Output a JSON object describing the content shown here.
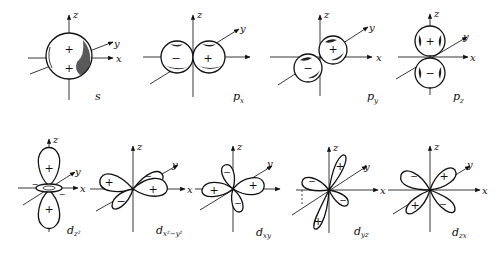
{
  "figure": {
    "axes_labels": {
      "x": "x",
      "y": "y",
      "z": "z"
    },
    "orbitals": [
      {
        "id": "s",
        "label_main": "s",
        "label_sub": "",
        "signs": [
          "+",
          "+"
        ]
      },
      {
        "id": "px",
        "label_main": "p",
        "label_sub": "x",
        "signs": [
          "−",
          "+"
        ]
      },
      {
        "id": "py",
        "label_main": "p",
        "label_sub": "y",
        "signs": [
          "−",
          "+"
        ]
      },
      {
        "id": "pz",
        "label_main": "p",
        "label_sub": "z",
        "signs": [
          "+",
          "−"
        ]
      },
      {
        "id": "dz2",
        "label_main": "d",
        "label_sub": "z²",
        "signs": [
          "+",
          "+",
          "−",
          "−"
        ]
      },
      {
        "id": "dx2y2",
        "label_main": "d",
        "label_sub": "x²−y²",
        "signs": [
          "+",
          "−",
          "−",
          "+"
        ]
      },
      {
        "id": "dxy",
        "label_main": "d",
        "label_sub": "xy",
        "signs": [
          "−",
          "+",
          "+",
          "−"
        ]
      },
      {
        "id": "dyz",
        "label_main": "d",
        "label_sub": "yz",
        "signs": [
          "−",
          "+",
          "+",
          "−"
        ]
      },
      {
        "id": "dzx",
        "label_main": "d",
        "label_sub": "zx",
        "signs": [
          "−",
          "+",
          "+",
          "−"
        ]
      }
    ]
  }
}
